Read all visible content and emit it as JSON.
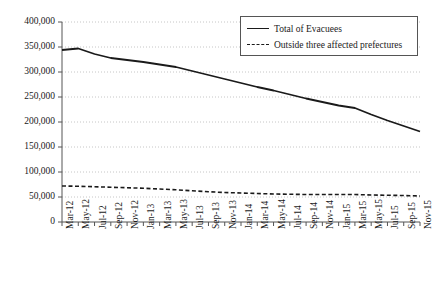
{
  "chart_data": {
    "type": "line",
    "title": "",
    "xlabel": "",
    "ylabel": "",
    "ylim": [
      0,
      400000
    ],
    "ytick_labels": [
      "400,000",
      "350,000",
      "300,000",
      "250,000",
      "200,000",
      "150,000",
      "100,000",
      "50,000",
      "0"
    ],
    "ytick_values": [
      400000,
      350000,
      300000,
      250000,
      200000,
      150000,
      100000,
      50000,
      0
    ],
    "grid": "horizontal-dotted",
    "legend_position": "top-right",
    "categories": [
      "Mar-12",
      "May-12",
      "Jul-12",
      "Sep-12",
      "Nov-12",
      "Jan-13",
      "Mar-13",
      "May-13",
      "Jul-13",
      "Sep-13",
      "Nov-13",
      "Jan-14",
      "Mar-14",
      "May-14",
      "Jul-14",
      "Sep-14",
      "Nov-14",
      "Jan-15",
      "Mar-15",
      "May-15",
      "Jul-15",
      "Sep-15",
      "Nov-15"
    ],
    "series": [
      {
        "name": "Total of Evacuees",
        "style": "solid",
        "color": "#1a1a1a",
        "values": [
          344000,
          347000,
          336000,
          328000,
          324000,
          320000,
          315000,
          310000,
          302000,
          294000,
          286000,
          278000,
          270000,
          263000,
          255000,
          247000,
          240000,
          233000,
          228000,
          215000,
          203000,
          192000,
          181000
        ]
      },
      {
        "name": "Outside three affected prefectures",
        "style": "dashed",
        "color": "#1a1a1a",
        "values": [
          72000,
          71500,
          70500,
          69500,
          68500,
          67500,
          66000,
          64500,
          62500,
          60500,
          59000,
          58000,
          57000,
          56000,
          55500,
          55000,
          55000,
          55000,
          55000,
          54000,
          53500,
          53000,
          52000
        ]
      }
    ]
  },
  "legend": {
    "items": [
      {
        "label": "Total of Evacuees",
        "style": "solid"
      },
      {
        "label": "Outside three affected prefectures",
        "style": "dashed"
      }
    ]
  }
}
